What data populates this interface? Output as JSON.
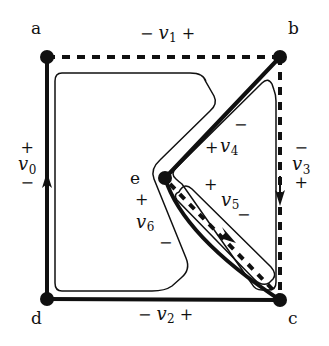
{
  "figure": {
    "type": "circuit-graph-diagram",
    "background_color": "#ffffff",
    "ink_color": "#101010"
  },
  "nodes": [
    {
      "id": "a",
      "label": "a",
      "x": 47,
      "y": 57,
      "label_x": 31,
      "label_y": 28
    },
    {
      "id": "b",
      "label": "b",
      "x": 280,
      "y": 57,
      "label_x": 288,
      "label_y": 28
    },
    {
      "id": "c",
      "label": "c",
      "x": 280,
      "y": 300,
      "label_x": 288,
      "label_y": 318
    },
    {
      "id": "d",
      "label": "d",
      "x": 47,
      "y": 299,
      "label_x": 31,
      "label_y": 318
    },
    {
      "id": "e",
      "label": "e",
      "x": 165,
      "y": 178,
      "label_x": 134,
      "label_y": 170
    }
  ],
  "edges": [
    {
      "id": "v0",
      "from": "d",
      "to": "a",
      "style": "solid",
      "arrow": "up",
      "arrow_x": 47,
      "arrow_y": 185
    },
    {
      "id": "v1",
      "from": "a",
      "to": "b",
      "style": "dashed",
      "arrow": "none"
    },
    {
      "id": "v2",
      "from": "d",
      "to": "c",
      "style": "solid",
      "arrow": "none"
    },
    {
      "id": "v3",
      "from": "b",
      "to": "c",
      "style": "dashed",
      "arrow": "down",
      "arrow_x": 280,
      "arrow_y": 197
    },
    {
      "id": "v4",
      "from": "e",
      "to": "b",
      "style": "solid",
      "arrow": "none"
    },
    {
      "id": "v5",
      "from": "e",
      "to": "c",
      "style": "dashed",
      "arrow": "down-right",
      "arrow_x": 225,
      "arrow_y": 232
    },
    {
      "id": "v6",
      "from": "e",
      "to": "c",
      "style": "solid",
      "arrow": "none"
    }
  ],
  "voltage_labels": [
    {
      "id": "v0",
      "name": "v",
      "subscript": "0",
      "orientation": "vertical",
      "top_sign": "+",
      "bottom_sign": "−",
      "x": 26,
      "y": 148
    },
    {
      "id": "v1",
      "name": "v",
      "subscript": "1",
      "orientation": "horizontal",
      "left_sign": "−",
      "right_sign": "+",
      "x": 145,
      "y": 26
    },
    {
      "id": "v2",
      "name": "v",
      "subscript": "2",
      "orientation": "horizontal",
      "left_sign": "−",
      "right_sign": "+",
      "x": 142,
      "y": 307
    },
    {
      "id": "v3",
      "name": "v",
      "subscript": "3",
      "orientation": "vertical",
      "top_sign": "−",
      "bottom_sign": "+",
      "x": 300,
      "y": 148
    },
    {
      "id": "v4",
      "name": "v",
      "subscript": "4",
      "orientation": "diagonal",
      "plus_sign": "+",
      "minus_sign": "−",
      "x": 224,
      "y": 146,
      "plus_x": 209,
      "plus_y": 148,
      "minus_x": 237,
      "minus_y": 125
    },
    {
      "id": "v5",
      "name": "v",
      "subscript": "5",
      "orientation": "diagonal",
      "plus_sign": "+",
      "minus_sign": "−",
      "x": 225,
      "y": 200,
      "plus_x": 208,
      "plus_y": 185,
      "minus_x": 240,
      "minus_y": 214
    },
    {
      "id": "v6",
      "name": "v",
      "subscript": "6",
      "orientation": "diagonal",
      "plus_sign": "+",
      "minus_sign": "−",
      "x": 140,
      "y": 222,
      "plus_x": 139,
      "plus_y": 200,
      "minus_x": 163,
      "minus_y": 243
    }
  ],
  "mesh_loops": [
    {
      "id": "loop-left",
      "description": "large thin loop around region a-d-c-e-b"
    },
    {
      "id": "loop-upper",
      "description": "thin loop around region e-b-c"
    },
    {
      "id": "loop-lower",
      "description": "narrow elongated loop around region e-c"
    }
  ]
}
